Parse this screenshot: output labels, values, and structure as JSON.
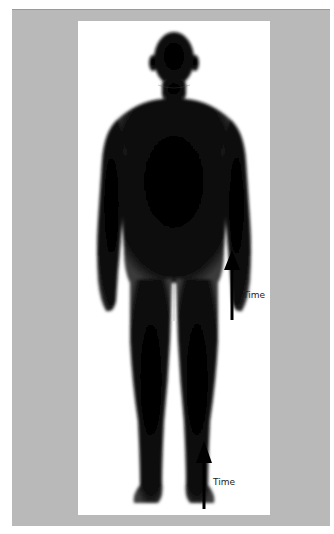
{
  "figure": {
    "background_color": "#b9b9b9",
    "panel_color": "#ffffff",
    "silhouette_color": "#0a0a0a"
  },
  "annotations": [
    {
      "label": "Time",
      "direction": "up",
      "position": "mid-right"
    },
    {
      "label": "Time",
      "direction": "up",
      "position": "bottom"
    }
  ]
}
